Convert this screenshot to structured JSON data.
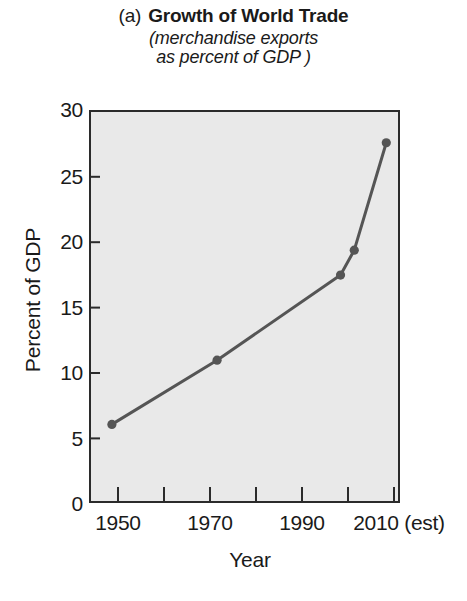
{
  "figure": {
    "panel_label": "(a)",
    "title": "Growth of World Trade",
    "subtitle_line1": "(merchandise exports",
    "subtitle_line2": "as percent of GDP )"
  },
  "axes": {
    "xlabel": "Year",
    "ylabel": "Percent of GDP"
  },
  "colors": {
    "line": "#555555",
    "marker": "#555555",
    "plot_background": "#e9e9e9",
    "axis": "#2b2b2b",
    "text": "#1a1a1a"
  },
  "chart_data": {
    "type": "line",
    "subtitle": "(merchandise exports as percent of GDP )",
    "xlabel": "Year",
    "ylabel": "Percent of GDP",
    "xlim": [
      1945,
      2013
    ],
    "ylim": [
      0,
      30
    ],
    "grid": false,
    "legend": false,
    "x_major_ticks": [
      1950,
      1970,
      1990,
      2010
    ],
    "x_major_tick_labels": [
      "1950",
      "1970",
      "1990",
      "2010 (est)"
    ],
    "x_minor_ticks": [
      1960,
      1980,
      2000
    ],
    "y_ticks": [
      0,
      5,
      10,
      15,
      20,
      25,
      30
    ],
    "y_tick_labels": [
      "0",
      "5",
      "10",
      "15",
      "20",
      "25",
      "30"
    ],
    "series": [
      {
        "name": "Merchandise exports as percent of GDP",
        "x": [
          1950,
          1973,
          2000,
          2003,
          2010
        ],
        "y": [
          6.0,
          10.9,
          17.4,
          19.3,
          27.5
        ],
        "marker": "circle",
        "color": "#555555"
      }
    ]
  }
}
